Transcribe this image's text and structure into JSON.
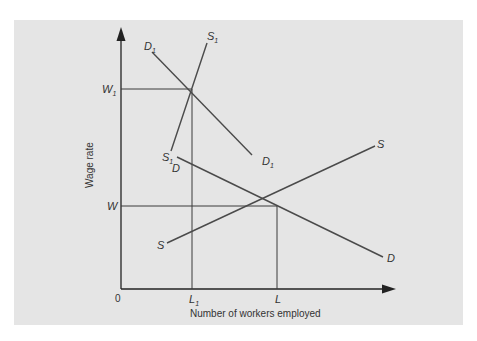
{
  "diagram": {
    "type": "labor-market-supply-demand",
    "colors": {
      "background": "#e5e5e5",
      "axis": "#222222",
      "curves": "#4a4a4a",
      "labels": "#333333"
    },
    "axes": {
      "x_label": "Number of workers employed",
      "y_label": "Wage rate",
      "origin_label": "0"
    },
    "levels": {
      "w1": {
        "main": "W",
        "sub": "1"
      },
      "w": {
        "main": "W",
        "sub": ""
      },
      "l1": {
        "main": "L",
        "sub": "1"
      },
      "l": {
        "main": "L",
        "sub": ""
      }
    },
    "curves": {
      "d1_top": {
        "main": "D",
        "sub": "1"
      },
      "d1_bottom": {
        "main": "D",
        "sub": "1"
      },
      "s1_top": {
        "main": "S",
        "sub": "1"
      },
      "s1_bottom": {
        "main": "S",
        "sub": "1"
      },
      "d_top": {
        "main": "D",
        "sub": ""
      },
      "d_bottom": {
        "main": "D",
        "sub": ""
      },
      "s_top": {
        "main": "S",
        "sub": ""
      },
      "s_bottom": {
        "main": "S",
        "sub": ""
      }
    }
  }
}
